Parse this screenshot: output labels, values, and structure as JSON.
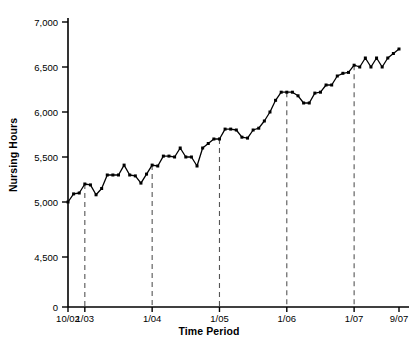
{
  "chart_data": {
    "type": "line",
    "title": "",
    "xlabel": "Time Period",
    "ylabel": "Nursing Hours",
    "ylim": [
      4400,
      7000
    ],
    "y_ticks": [
      0,
      4500,
      5000,
      5500,
      6000,
      6500,
      7000
    ],
    "y_tick_labels": [
      "0",
      "4,500",
      "5,000",
      "5,500",
      "6,000",
      "6,500",
      "7,000"
    ],
    "axis_break": true,
    "axis_break_note": "y-axis jumps from 0 directly to 4,500",
    "grid": false,
    "legend": null,
    "marker": "square",
    "line_color": "#000000",
    "x_tick_labels": [
      "10/02",
      "1/03",
      "1/04",
      "1/05",
      "1/06",
      "1/07",
      "9/07"
    ],
    "x_tick_indices": [
      0,
      3,
      15,
      27,
      39,
      51,
      59
    ],
    "reference_lines": [
      {
        "label": "1/03",
        "index": 3,
        "style": "dashed"
      },
      {
        "label": "1/04",
        "index": 15,
        "style": "dashed"
      },
      {
        "label": "1/05",
        "index": 27,
        "style": "dashed"
      },
      {
        "label": "1/06",
        "index": 39,
        "style": "dashed"
      },
      {
        "label": "1/07",
        "index": 51,
        "style": "dashed"
      }
    ],
    "x": [
      "10/02",
      "11/02",
      "12/02",
      "1/03",
      "2/03",
      "3/03",
      "4/03",
      "5/03",
      "6/03",
      "7/03",
      "8/03",
      "9/03",
      "10/03",
      "11/03",
      "12/03",
      "1/04",
      "2/04",
      "3/04",
      "4/04",
      "5/04",
      "6/04",
      "7/04",
      "8/04",
      "9/04",
      "10/04",
      "11/04",
      "12/04",
      "1/05",
      "2/05",
      "3/05",
      "4/05",
      "5/05",
      "6/05",
      "7/05",
      "8/05",
      "9/05",
      "10/05",
      "11/05",
      "12/05",
      "1/06",
      "2/06",
      "3/06",
      "4/06",
      "5/06",
      "6/06",
      "7/06",
      "8/06",
      "9/06",
      "10/06",
      "11/06",
      "12/06",
      "1/07",
      "2/07",
      "3/07",
      "4/07",
      "5/07",
      "6/07",
      "7/07",
      "8/07",
      "9/07"
    ],
    "values": [
      5000,
      5090,
      5100,
      5200,
      5190,
      5080,
      5150,
      5300,
      5300,
      5300,
      5410,
      5300,
      5290,
      5210,
      5310,
      5410,
      5400,
      5510,
      5510,
      5500,
      5600,
      5500,
      5500,
      5400,
      5600,
      5650,
      5700,
      5700,
      5810,
      5810,
      5800,
      5720,
      5710,
      5800,
      5820,
      5900,
      6000,
      6130,
      6220,
      6220,
      6220,
      6180,
      6100,
      6100,
      6210,
      6220,
      6300,
      6300,
      6400,
      6430,
      6440,
      6520,
      6500,
      6600,
      6500,
      6600,
      6500,
      6600,
      6650,
      6700
    ],
    "n_points": 60
  },
  "axes": {
    "y_axis_title": "Nursing Hours",
    "x_axis_title": "Time Period"
  }
}
